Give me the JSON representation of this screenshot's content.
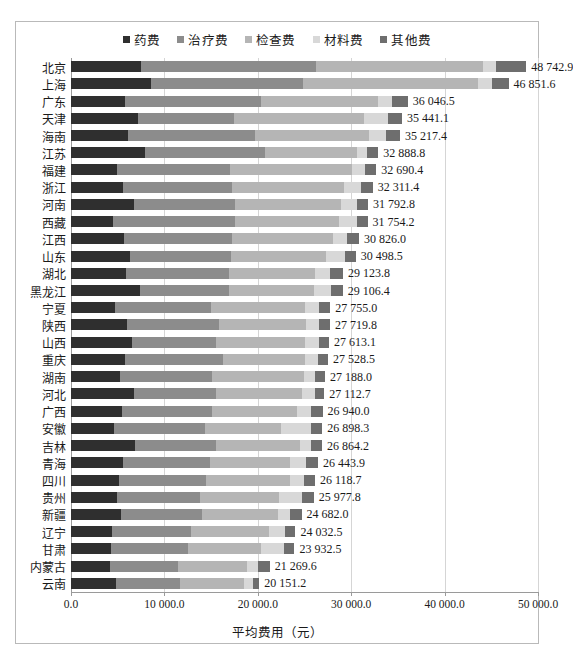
{
  "chart_data": {
    "type": "bar",
    "orientation": "horizontal",
    "stacked": true,
    "title": "",
    "xlabel": "平均费用（元）",
    "ylabel": "",
    "xlim": [
      0,
      50000
    ],
    "xticks": [
      "0.0",
      "10 000.0",
      "20 000.0",
      "30 000.0",
      "40 000.0",
      "50 000.0"
    ],
    "xtick_values": [
      0,
      10000,
      20000,
      30000,
      40000,
      50000
    ],
    "grid": true,
    "legend_position": "top-center",
    "legend": [
      "药费",
      "治疗费",
      "检查费",
      "材料费",
      "其他费"
    ],
    "colors": [
      "#2f2f2f",
      "#8c8c8c",
      "#b5b5b5",
      "#d8d8d8",
      "#6e6e6e"
    ],
    "categories": [
      "北京",
      "上海",
      "广东",
      "天津",
      "海南",
      "江苏",
      "福建",
      "浙江",
      "河南",
      "西藏",
      "江西",
      "山东",
      "湖北",
      "黑龙江",
      "宁夏",
      "陕西",
      "山西",
      "重庆",
      "湖南",
      "河北",
      "广西",
      "安徽",
      "吉林",
      "青海",
      "四川",
      "贵州",
      "新疆",
      "辽宁",
      "甘肃",
      "内蒙古",
      "云南"
    ],
    "totals": [
      48742.9,
      46851.6,
      36046.5,
      35441.1,
      35217.4,
      32888.8,
      32690.4,
      32311.4,
      31792.8,
      31754.2,
      30826.0,
      30498.5,
      29123.8,
      29106.4,
      27755.0,
      27719.8,
      27613.1,
      27528.5,
      27188.0,
      27112.7,
      26940.0,
      26898.3,
      26864.2,
      26443.9,
      26118.7,
      25977.8,
      24682.0,
      24032.5,
      23932.5,
      21269.6,
      20151.2
    ],
    "total_labels": [
      "48 742.9",
      "46 851.6",
      "36 046.5",
      "35 441.1",
      "35 217.4",
      "32 888.8",
      "32 690.4",
      "32 311.4",
      "31 792.8",
      "31 754.2",
      "30 826.0",
      "30 498.5",
      "29 123.8",
      "29 106.4",
      "27 755.0",
      "27 719.8",
      "27 613.1",
      "27 528.5",
      "27 188.0",
      "27 112.7",
      "26 940.0",
      "26 898.3",
      "26 864.2",
      "26 443.9",
      "26 118.7",
      "25 977.8",
      "24 682.0",
      "24 032.5",
      "23 932.5",
      "21 269.6",
      "20 151.2"
    ],
    "series": [
      {
        "name": "药费",
        "values": [
          7500,
          8600,
          5800,
          7200,
          6100,
          7900,
          4900,
          5600,
          6700,
          4500,
          5700,
          6300,
          5900,
          7400,
          4700,
          6000,
          6600,
          5800,
          5200,
          6700,
          5500,
          4600,
          6900,
          5600,
          5100,
          4900,
          5300,
          4400,
          4300,
          4200,
          4800
        ]
      },
      {
        "name": "治疗费",
        "values": [
          18700,
          16200,
          14500,
          10300,
          13600,
          12900,
          12100,
          11600,
          10900,
          13100,
          11500,
          10800,
          11000,
          9500,
          10300,
          9800,
          9200,
          10500,
          9900,
          8800,
          9600,
          9700,
          8600,
          9300,
          9400,
          8900,
          8700,
          8500,
          8200,
          7300,
          6900
        ]
      },
      {
        "name": "检查费",
        "values": [
          17900,
          18800,
          12600,
          13900,
          12200,
          9800,
          13100,
          12000,
          11300,
          11100,
          10800,
          10200,
          9200,
          9100,
          10100,
          9400,
          9600,
          8800,
          9800,
          9200,
          9100,
          8200,
          9000,
          8600,
          8900,
          8500,
          8200,
          8300,
          7800,
          7300,
          6800
        ]
      },
      {
        "name": "材料费",
        "values": [
          1400,
          1500,
          1500,
          2500,
          1800,
          1100,
          1400,
          1900,
          1700,
          1900,
          1600,
          2000,
          1600,
          1800,
          1500,
          1400,
          1500,
          1300,
          1200,
          1400,
          1500,
          3200,
          1200,
          1700,
          1500,
          2400,
          1200,
          1700,
          2500,
          1200,
          1000
        ]
      },
      {
        "name": "其他费",
        "values": [
          3242.9,
          1751.6,
          1646.5,
          1541.1,
          1517.4,
          1188.8,
          1190.4,
          1211.4,
          1192.8,
          1154.2,
          1226.0,
          1198.5,
          1423.8,
          1306.4,
          1155.0,
          1119.8,
          1113.1,
          1128.5,
          1088.0,
          1012.7,
          1240.0,
          1198.3,
          1164.2,
          1243.9,
          1218.7,
          1287.8,
          1282.0,
          1132.5,
          1132.5,
          1269.6,
          651.2
        ]
      }
    ]
  }
}
